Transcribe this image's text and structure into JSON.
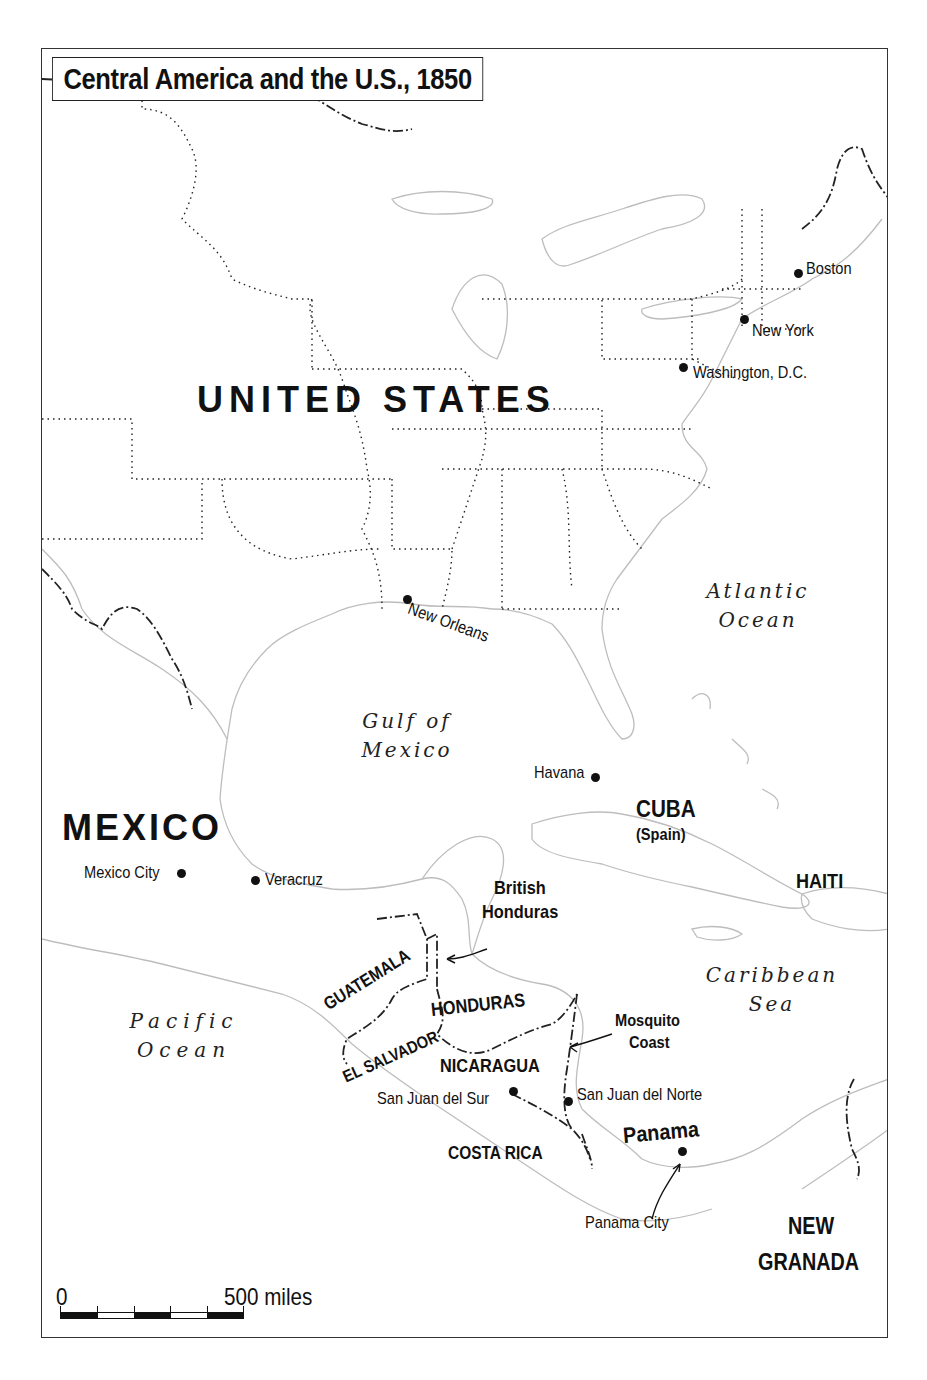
{
  "map": {
    "title": "Central America and the U.S., 1850",
    "countries": {
      "united_states": "UNITED STATES",
      "mexico": "MEXICO",
      "cuba": "CUBA",
      "cuba_note": "(Spain)",
      "haiti": "HAITI",
      "british_honduras_line1": "British",
      "british_honduras_line2": "Honduras",
      "guatemala": "GUATEMALA",
      "honduras": "HONDURAS",
      "el_salvador": "EL SALVADOR",
      "nicaragua": "NICARAGUA",
      "costa_rica": "COSTA RICA",
      "panama": "Panama",
      "new_granada_line1": "NEW",
      "new_granada_line2": "GRANADA",
      "mosquito_coast_line1": "Mosquito",
      "mosquito_coast_line2": "Coast"
    },
    "cities": {
      "boston": "Boston",
      "new_york": "New York",
      "washington": "Washington, D.C.",
      "new_orleans": "New Orleans",
      "havana": "Havana",
      "mexico_city": "Mexico City",
      "veracruz": "Veracruz",
      "san_juan_del_sur": "San Juan del Sur",
      "san_juan_del_norte": "San Juan del Norte",
      "panama_city": "Panama City"
    },
    "water": {
      "atlantic_line1": "Atlantic",
      "atlantic_line2": "Ocean",
      "gulf_line1": "Gulf of",
      "gulf_line2": "Mexico",
      "caribbean_line1": "Caribbean",
      "caribbean_line2": "Sea",
      "pacific_line1": "Pacific",
      "pacific_line2": "Ocean"
    },
    "scale": {
      "start_label": "0",
      "end_label": "500 miles"
    },
    "colors": {
      "ink": "#111111",
      "coastline": "#b8b8b8",
      "background": "#ffffff"
    }
  }
}
